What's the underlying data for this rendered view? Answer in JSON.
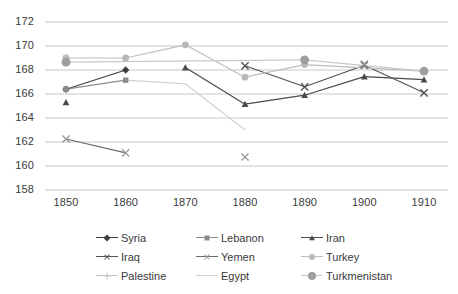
{
  "chart_data": {
    "type": "line",
    "title": "",
    "subtitle": "",
    "xlabel": "",
    "ylabel": "",
    "x": [
      1850,
      1860,
      1870,
      1880,
      1890,
      1900,
      1910
    ],
    "xtick_labels": [
      "1850",
      "1860",
      "1870",
      "1880",
      "1890",
      "1900",
      "1910"
    ],
    "ytick_labels": [
      "158",
      "160",
      "162",
      "164",
      "166",
      "168",
      "170",
      "172"
    ],
    "ylim": [
      158,
      172
    ],
    "ytick_step": 2,
    "xlim": [
      1845,
      1915
    ],
    "grid": "horizontal",
    "legend_position": "bottom",
    "legend_columns": 3,
    "series": [
      {
        "name": "Syria",
        "marker": "diamond",
        "color": "#3f3f3f",
        "line_color": "#3f3f3f",
        "points": [
          {
            "x": 1850,
            "y": 166.4
          },
          {
            "x": 1860,
            "y": 168.0
          }
        ]
      },
      {
        "name": "Lebanon",
        "marker": "square",
        "color": "#8c8c8c",
        "line_color": "#8c8c8c",
        "points": [
          {
            "x": 1850,
            "y": 166.4
          },
          {
            "x": 1860,
            "y": 167.15
          }
        ]
      },
      {
        "name": "Iran",
        "marker": "triangle",
        "color": "#4a4a4a",
        "line_color": "#4a4a4a",
        "points": [
          {
            "x": 1850,
            "y": 165.3
          },
          {
            "x": 1870,
            "y": 168.2
          },
          {
            "x": 1880,
            "y": 165.15
          },
          {
            "x": 1890,
            "y": 165.9
          },
          {
            "x": 1900,
            "y": 167.45
          },
          {
            "x": 1910,
            "y": 167.2
          }
        ],
        "gaps": [
          [
            1850,
            1870
          ]
        ]
      },
      {
        "name": "Iraq",
        "marker": "x",
        "color": "#545454",
        "line_color": "#545454",
        "points": [
          {
            "x": 1880,
            "y": 168.35
          },
          {
            "x": 1890,
            "y": 166.6
          },
          {
            "x": 1900,
            "y": 168.4
          },
          {
            "x": 1910,
            "y": 166.1
          }
        ]
      },
      {
        "name": "Yemen",
        "marker": "x",
        "color": "#9a9a9a",
        "line_color": "#6a6a6a",
        "points": [
          {
            "x": 1850,
            "y": 162.25
          },
          {
            "x": 1860,
            "y": 161.1
          },
          {
            "x": 1880,
            "y": 160.75
          },
          {
            "x": 1900,
            "y": 168.5
          }
        ],
        "gaps": [
          [
            1860,
            1880
          ],
          [
            1880,
            1900
          ]
        ]
      },
      {
        "name": "Turkey",
        "marker": "circle",
        "color": "#b8b8b8",
        "line_color": "#bdbdbd",
        "points": [
          {
            "x": 1850,
            "y": 169.0
          },
          {
            "x": 1860,
            "y": 169.0
          },
          {
            "x": 1870,
            "y": 170.1
          },
          {
            "x": 1880,
            "y": 167.4
          },
          {
            "x": 1890,
            "y": 168.45
          },
          {
            "x": 1910,
            "y": 167.9
          }
        ]
      },
      {
        "name": "Palestine",
        "marker": "plus",
        "color": "#c4c4c4",
        "line_color": "#c4c4c4",
        "points": [
          {
            "x": 1850,
            "y": 169.0
          }
        ]
      },
      {
        "name": "Egypt",
        "marker": "none",
        "color": "#d2d2d2",
        "line_color": "#d2d2d2",
        "points": [
          {
            "x": 1860,
            "y": 167.15
          },
          {
            "x": 1870,
            "y": 166.85
          },
          {
            "x": 1880,
            "y": 163.0
          }
        ]
      },
      {
        "name": "Turkmenistan",
        "marker": "bigcircle",
        "color": "#9e9e9e",
        "line_color": "#c9c9c9",
        "points": [
          {
            "x": 1850,
            "y": 168.65
          },
          {
            "x": 1890,
            "y": 168.85
          },
          {
            "x": 1910,
            "y": 167.9
          }
        ]
      }
    ]
  },
  "legend": {
    "entries": [
      {
        "label": "Syria"
      },
      {
        "label": "Lebanon"
      },
      {
        "label": "Iran"
      },
      {
        "label": "Iraq"
      },
      {
        "label": "Yemen"
      },
      {
        "label": "Turkey"
      },
      {
        "label": "Palestine"
      },
      {
        "label": "Egypt"
      },
      {
        "label": "Turkmenistan"
      }
    ]
  },
  "colors": {
    "gridline": "#c8c8c8",
    "axis_text": "#3a3a3a",
    "background": "#ffffff"
  }
}
